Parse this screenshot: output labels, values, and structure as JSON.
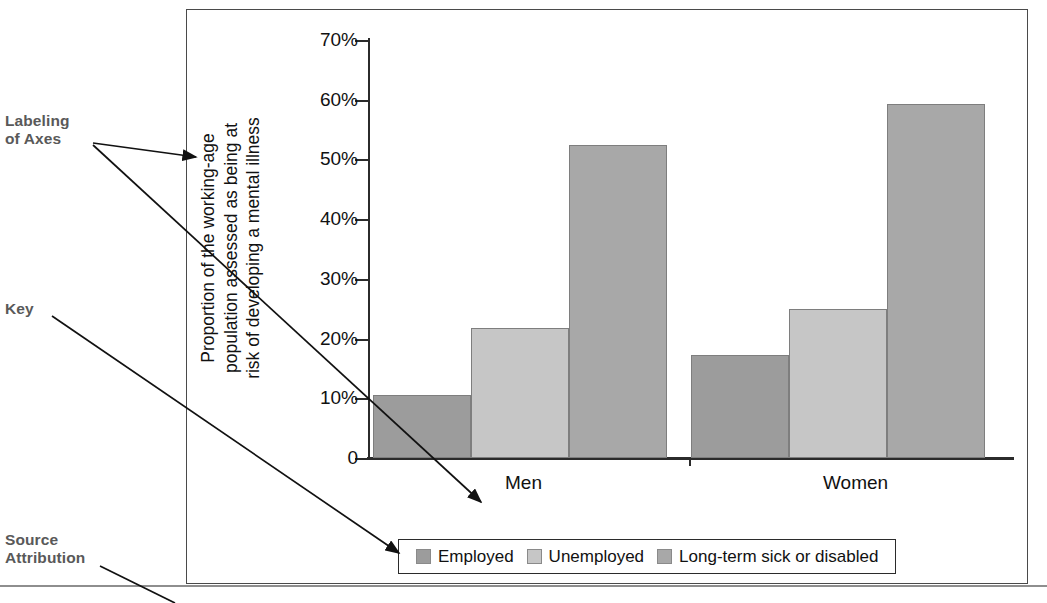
{
  "annotations": {
    "axes": "Labeling\nof Axes",
    "key": "Key",
    "source": "Source\nAttribution"
  },
  "legend": {
    "items": [
      {
        "label": "Employed",
        "color": "#9c9c9c"
      },
      {
        "label": "Unemployed",
        "color": "#c6c6c6"
      },
      {
        "label": "Long-term sick or disabled",
        "color": "#a8a8a8"
      }
    ]
  },
  "axis": {
    "y_title": "Proportion of the working-age\npopulation assessed as being at\nrisk of developing a mental illness",
    "y_ticks": [
      "70%",
      "60%",
      "50%",
      "40%",
      "30%",
      "20%",
      "10%",
      "0"
    ]
  },
  "chart_data": {
    "type": "bar",
    "title": "",
    "xlabel": "",
    "ylabel": "Proportion of the working-age population assessed as being at risk of developing a mental illness",
    "categories": [
      "Men",
      "Women"
    ],
    "series": [
      {
        "name": "Employed",
        "values": [
          10.6,
          17.2
        ],
        "color": "#9c9c9c"
      },
      {
        "name": "Unemployed",
        "values": [
          21.8,
          24.9
        ],
        "color": "#c6c6c6"
      },
      {
        "name": "Long-term sick or disabled",
        "values": [
          52.5,
          59.3
        ],
        "color": "#a8a8a8"
      }
    ],
    "ylim": [
      0,
      70
    ],
    "ytick_values": [
      0,
      10,
      20,
      30,
      40,
      50,
      60,
      70
    ],
    "ytick_labels": [
      "0",
      "10%",
      "20%",
      "30%",
      "40%",
      "50%",
      "60%",
      "70%"
    ],
    "grid": false,
    "legend_position": "bottom"
  }
}
